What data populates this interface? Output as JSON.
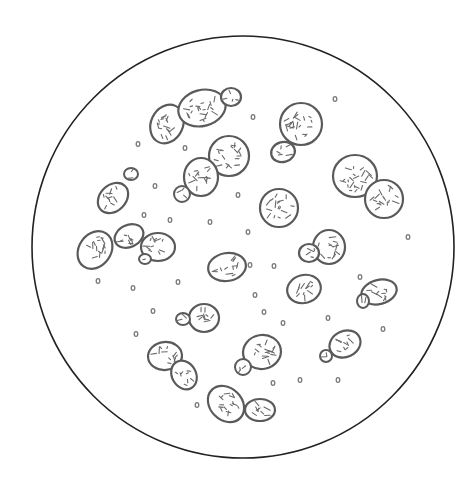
{
  "figure": {
    "title": "Yeast cells under microscope",
    "field": {
      "cx": 243,
      "cy": 247,
      "r": 211,
      "stroke": "#222222"
    },
    "cell_color": "#5a5a5a",
    "cells": [
      {
        "cx": 167,
        "cy": 124,
        "rx": 16,
        "ry": 20,
        "rot": 25
      },
      {
        "cx": 202,
        "cy": 108,
        "rx": 24,
        "ry": 18,
        "rot": -15
      },
      {
        "cx": 231,
        "cy": 97,
        "rx": 10,
        "ry": 9,
        "rot": 0
      },
      {
        "cx": 301,
        "cy": 124,
        "rx": 21,
        "ry": 21,
        "rot": 0
      },
      {
        "cx": 283,
        "cy": 152,
        "rx": 12,
        "ry": 10,
        "rot": -15
      },
      {
        "cx": 229,
        "cy": 156,
        "rx": 20,
        "ry": 20,
        "rot": 0
      },
      {
        "cx": 201,
        "cy": 177,
        "rx": 17,
        "ry": 19,
        "rot": 0
      },
      {
        "cx": 182,
        "cy": 194,
        "rx": 8,
        "ry": 8,
        "rot": 0
      },
      {
        "cx": 355,
        "cy": 176,
        "rx": 22,
        "ry": 21,
        "rot": 0
      },
      {
        "cx": 384,
        "cy": 199,
        "rx": 19,
        "ry": 19,
        "rot": 0
      },
      {
        "cx": 279,
        "cy": 208,
        "rx": 19,
        "ry": 19,
        "rot": 0
      },
      {
        "cx": 113,
        "cy": 198,
        "rx": 13,
        "ry": 17,
        "rot": 45
      },
      {
        "cx": 131,
        "cy": 174,
        "rx": 7,
        "ry": 6,
        "rot": 0
      },
      {
        "cx": 95,
        "cy": 250,
        "rx": 16,
        "ry": 20,
        "rot": 35
      },
      {
        "cx": 129,
        "cy": 236,
        "rx": 15,
        "ry": 11,
        "rot": -25
      },
      {
        "cx": 158,
        "cy": 247,
        "rx": 17,
        "ry": 14,
        "rot": 0
      },
      {
        "cx": 145,
        "cy": 259,
        "rx": 6,
        "ry": 5,
        "rot": 0
      },
      {
        "cx": 227,
        "cy": 267,
        "rx": 19,
        "ry": 14,
        "rot": -10
      },
      {
        "cx": 329,
        "cy": 247,
        "rx": 16,
        "ry": 17,
        "rot": 0
      },
      {
        "cx": 309,
        "cy": 253,
        "rx": 10,
        "ry": 9,
        "rot": 0
      },
      {
        "cx": 304,
        "cy": 289,
        "rx": 17,
        "ry": 14,
        "rot": -15
      },
      {
        "cx": 379,
        "cy": 292,
        "rx": 18,
        "ry": 12,
        "rot": -15
      },
      {
        "cx": 363,
        "cy": 301,
        "rx": 6,
        "ry": 7,
        "rot": 0
      },
      {
        "cx": 204,
        "cy": 318,
        "rx": 15,
        "ry": 14,
        "rot": 0
      },
      {
        "cx": 183,
        "cy": 319,
        "rx": 7,
        "ry": 6,
        "rot": 0
      },
      {
        "cx": 165,
        "cy": 356,
        "rx": 17,
        "ry": 14,
        "rot": -5
      },
      {
        "cx": 184,
        "cy": 375,
        "rx": 12,
        "ry": 15,
        "rot": -30
      },
      {
        "cx": 262,
        "cy": 352,
        "rx": 19,
        "ry": 17,
        "rot": -10
      },
      {
        "cx": 243,
        "cy": 367,
        "rx": 8,
        "ry": 8,
        "rot": 0
      },
      {
        "cx": 345,
        "cy": 344,
        "rx": 16,
        "ry": 13,
        "rot": -25
      },
      {
        "cx": 326,
        "cy": 356,
        "rx": 6,
        "ry": 6,
        "rot": 0
      },
      {
        "cx": 226,
        "cy": 404,
        "rx": 16,
        "ry": 20,
        "rot": -45
      },
      {
        "cx": 260,
        "cy": 410,
        "rx": 15,
        "ry": 11,
        "rot": 0
      }
    ],
    "specks": [
      [
        138,
        144
      ],
      [
        185,
        148
      ],
      [
        253,
        117
      ],
      [
        155,
        186
      ],
      [
        144,
        215
      ],
      [
        170,
        220
      ],
      [
        210,
        222
      ],
      [
        238,
        195
      ],
      [
        248,
        232
      ],
      [
        250,
        265
      ],
      [
        274,
        266
      ],
      [
        335,
        99
      ],
      [
        408,
        237
      ],
      [
        98,
        281
      ],
      [
        133,
        288
      ],
      [
        178,
        282
      ],
      [
        153,
        311
      ],
      [
        136,
        334
      ],
      [
        264,
        312
      ],
      [
        283,
        323
      ],
      [
        328,
        318
      ],
      [
        383,
        329
      ],
      [
        273,
        383
      ],
      [
        300,
        380
      ],
      [
        338,
        380
      ],
      [
        197,
        405
      ],
      [
        360,
        277
      ],
      [
        255,
        295
      ]
    ]
  }
}
